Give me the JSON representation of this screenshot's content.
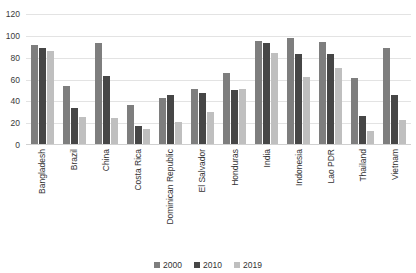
{
  "chart_data": {
    "type": "bar",
    "title": "",
    "subtitle": "",
    "xlabel": "",
    "ylabel": "",
    "ylim": [
      0,
      120
    ],
    "yticks": [
      0,
      20,
      40,
      60,
      80,
      100,
      120
    ],
    "grid": true,
    "legend_position": "bottom",
    "categories": [
      "Bangladesh",
      "Brazil",
      "China",
      "Costa Rica",
      "Dominican Republic",
      "El Salvador",
      "Honduras",
      "India",
      "Indonesia",
      "Lao PDR",
      "Thailand",
      "Vietnam"
    ],
    "series": [
      {
        "name": "2000",
        "color": "#7e7e7e",
        "values": [
          92,
          54,
          93,
          37,
          43,
          51,
          66,
          95,
          98,
          94,
          61,
          89
        ]
      },
      {
        "name": "2010",
        "color": "#464646",
        "values": [
          89,
          34,
          63,
          17,
          46,
          48,
          50,
          93,
          83,
          83,
          27,
          46
        ]
      },
      {
        "name": "2019",
        "color": "#bfbfbf",
        "values": [
          86,
          26,
          25,
          15,
          21,
          30,
          51,
          84,
          62,
          71,
          13,
          23
        ]
      }
    ]
  },
  "legend": {
    "items": [
      {
        "label": "2000",
        "color": "#7e7e7e"
      },
      {
        "label": "2010",
        "color": "#464646"
      },
      {
        "label": "2019",
        "color": "#bfbfbf"
      }
    ]
  },
  "colors": {
    "background": "#ffffff",
    "gridline": "#e3e3e3",
    "axis": "#d0d0d0",
    "text": "#333333"
  }
}
